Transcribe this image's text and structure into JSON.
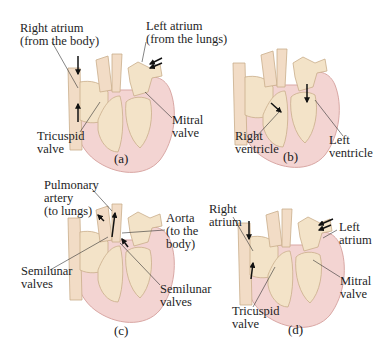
{
  "figure": {
    "colors": {
      "heart_outer": "#f3d4d2",
      "heart_outline": "#d9a7a4",
      "chamber_fill": "#f3e3c8",
      "chamber_outline": "#c9ad8a",
      "arrow": "#111111",
      "leader_line": "#333333"
    },
    "panels": [
      {
        "id": "a",
        "caption": "(a)",
        "labels": [
          {
            "lines": [
              "Right atrium",
              "(from the body)"
            ]
          },
          {
            "lines": [
              "Left atrium",
              "(from the lungs)"
            ]
          },
          {
            "lines": [
              "Tricuspid",
              "valve"
            ]
          },
          {
            "lines": [
              "Mitral",
              "valve"
            ]
          }
        ]
      },
      {
        "id": "b",
        "caption": "(b)",
        "labels": [
          {
            "lines": [
              "Right",
              "ventricle"
            ]
          },
          {
            "lines": [
              "Left",
              "ventricle"
            ]
          }
        ]
      },
      {
        "id": "c",
        "caption": "(c)",
        "labels": [
          {
            "lines": [
              "Pulmonary",
              "artery",
              "(to lungs)"
            ]
          },
          {
            "lines": [
              "Aorta",
              "(to the",
              "body)"
            ]
          },
          {
            "lines": [
              "Semilunar",
              "valves"
            ]
          },
          {
            "lines": [
              "Semilunar",
              "valves"
            ]
          }
        ]
      },
      {
        "id": "d",
        "caption": "(d)",
        "labels": [
          {
            "lines": [
              "Right",
              "atrium"
            ]
          },
          {
            "lines": [
              "Left",
              "atrium"
            ]
          },
          {
            "lines": [
              "Tricuspid",
              "valve"
            ]
          },
          {
            "lines": [
              "Mitral",
              "valve"
            ]
          }
        ]
      }
    ]
  }
}
